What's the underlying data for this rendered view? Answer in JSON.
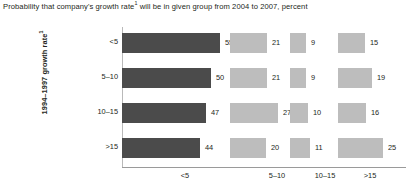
{
  "chart_data": {
    "type": "bar",
    "title_main": "Probability that company's growth rate",
    "title_footnote_marker": "1",
    "title_rest": " will be in given group from 2004 to 2007, percent",
    "ylabel_main": "1994–1997 growth rate",
    "ylabel_footnote_marker": "1",
    "ylabel": "1994–1997 growth rate¹",
    "xlabel": "",
    "orientation": "horizontal",
    "grid": false,
    "legend": "none",
    "unit": "percent",
    "categories": [
      "<5",
      "5–10",
      "10–15",
      ">15"
    ],
    "column_groups": [
      "<5",
      "5–10",
      "10–15",
      ">15"
    ],
    "rows": [
      {
        "label": "<5",
        "values": [
          55,
          21,
          9,
          15
        ]
      },
      {
        "label": "5–10",
        "values": [
          50,
          21,
          9,
          19
        ]
      },
      {
        "label": "10–15",
        "values": [
          47,
          27,
          10,
          16
        ]
      },
      {
        "label": ">15",
        "values": [
          44,
          20,
          11,
          25
        ]
      }
    ],
    "series": [
      {
        "name": "<5",
        "values": [
          55,
          50,
          47,
          44
        ]
      },
      {
        "name": "5–10",
        "values": [
          21,
          21,
          27,
          20
        ]
      },
      {
        "name": "10–15",
        "values": [
          9,
          9,
          10,
          11
        ]
      },
      {
        "name": ">15",
        "values": [
          15,
          19,
          16,
          25
        ]
      }
    ],
    "colors": {
      "first_column_bar": "#4b4b4b",
      "other_column_bars": "#bdbdbd",
      "axis_line": "#9a9a9a",
      "text": "#231f20",
      "background": "#ffffff"
    },
    "layout": {
      "column_left_px": [
        0,
        108,
        168,
        216
      ],
      "column_scale_px_per_unit": [
        1.78,
        1.78,
        1.78,
        1.78
      ],
      "row_top_px": [
        0,
        35,
        70,
        105
      ]
    }
  }
}
